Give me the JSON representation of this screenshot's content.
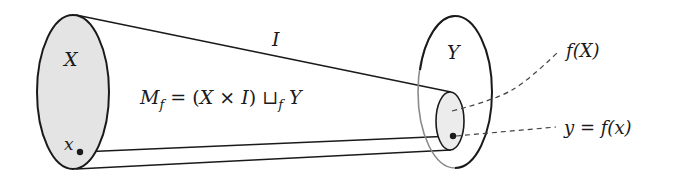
{
  "diagram": {
    "type": "mapping-cylinder",
    "labels": {
      "X": "X",
      "x": "x",
      "I": "I",
      "Y": "Y",
      "fX": "f(X)",
      "y_eq": "y = f(x)",
      "Mf_M": "M",
      "Mf_sub": "f",
      "Mf_rest1": " = (",
      "Mf_X": "X",
      "Mf_times": " × ",
      "Mf_I": "I",
      "Mf_close": ") ",
      "Mf_sqcup": "⊔",
      "Mf_sub2": "f",
      "Mf_Y": " Y"
    },
    "colors": {
      "stroke": "#1a1a1a",
      "fill_X": "#e4e4e4",
      "fill_fX": "#ececec",
      "hidden_arc": "#8a8a8a"
    }
  }
}
